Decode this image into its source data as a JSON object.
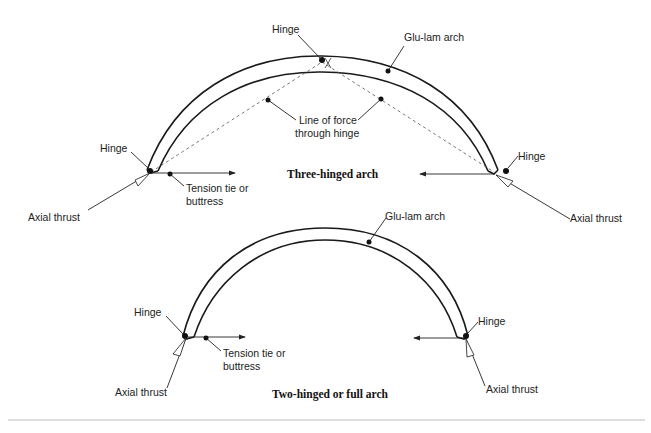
{
  "diagram": {
    "three_hinged": {
      "title": "Three-hinged arch",
      "labels": {
        "hinge_top": "Hinge",
        "glulam": "Glu-lam arch",
        "line_of_force_1": "Line of force",
        "line_of_force_2": "through hinge",
        "hinge_left": "Hinge",
        "hinge_right": "Hinge",
        "tension_tie_1": "Tension tie or",
        "tension_tie_2": "buttress",
        "axial_thrust_left": "Axial thrust",
        "axial_thrust_right": "Axial thrust"
      }
    },
    "two_hinged": {
      "title": "Two-hinged or full arch",
      "labels": {
        "glulam": "Glu-lam arch",
        "hinge_left": "Hinge",
        "hinge_right": "Hinge",
        "tension_tie_1": "Tension tie or",
        "tension_tie_2": "buttress",
        "axial_thrust_left": "Axial thrust",
        "axial_thrust_right": "Axial thrust"
      }
    },
    "colors": {
      "line": "#1a1a1a",
      "dashed": "#555555",
      "divider": "#bdbdbd"
    }
  }
}
